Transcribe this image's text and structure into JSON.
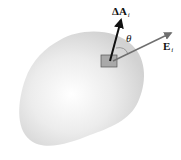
{
  "figure": {
    "labels": {
      "area_vector": {
        "main": "ΔA",
        "subscript": "i"
      },
      "field_vector": {
        "main": "E",
        "subscript": "i"
      },
      "angle": "θ"
    },
    "colors": {
      "surface_fill": "#e6e6e6",
      "surface_highlight": "#ffffff",
      "element_fill": "#a9a9a9",
      "area_arrow": "#111111",
      "field_arrow": "#6f6f6f",
      "background": "#ffffff"
    }
  }
}
